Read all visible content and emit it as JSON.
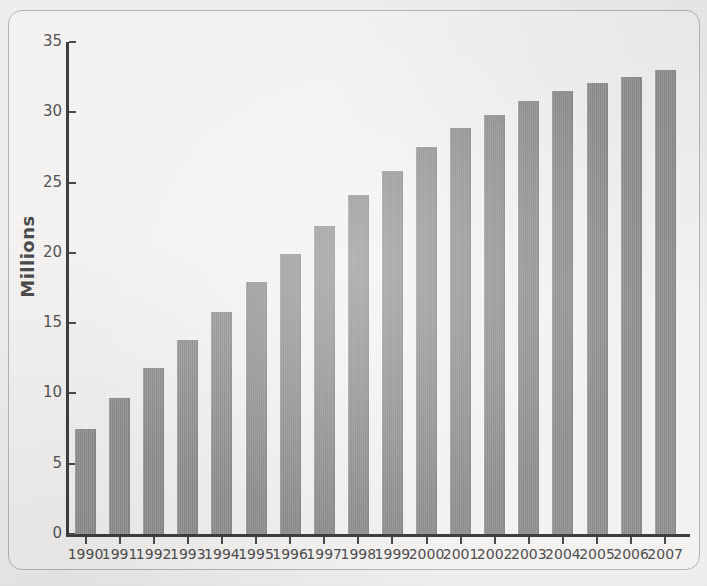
{
  "figure": {
    "background_color": "#f3f2f0",
    "frame_color": "#b9b7b4",
    "bar_color": "#969595",
    "axis_color": "#3d3d3d",
    "text_color": "#4f4d4d"
  },
  "chart_data": {
    "type": "bar",
    "title": "",
    "subtitle": "",
    "xlabel": "",
    "ylabel": "Millions",
    "categories": [
      "1990",
      "1991",
      "1992",
      "1993",
      "1994",
      "1995",
      "1996",
      "1997",
      "1998",
      "1999",
      "2000",
      "2001",
      "2002",
      "2003",
      "2004",
      "2005",
      "2006",
      "2007"
    ],
    "values": [
      7.5,
      9.7,
      11.8,
      13.8,
      15.8,
      17.9,
      19.9,
      21.9,
      24.1,
      25.8,
      27.5,
      28.9,
      29.8,
      30.8,
      31.5,
      32.1,
      32.5,
      33.0
    ],
    "ylim": [
      0,
      35
    ],
    "yticks": [
      0,
      5,
      10,
      15,
      20,
      25,
      30,
      35
    ],
    "ytick_labels": [
      "0",
      "5",
      "10",
      "15",
      "20",
      "25",
      "30",
      "35"
    ],
    "grid": false,
    "legend": null,
    "legend_position": "none",
    "annotations": []
  }
}
